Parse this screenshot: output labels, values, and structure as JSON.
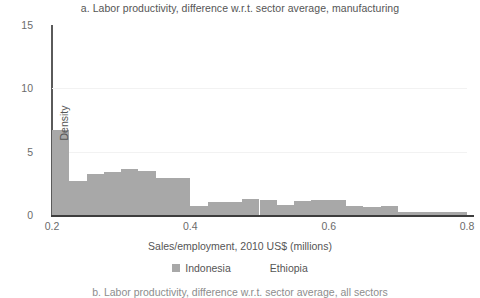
{
  "figure": {
    "panel_a_title": "a. Labor productivity, difference w.r.t. sector average, manufacturing",
    "panel_b_title": "b. Labor productivity, difference w.r.t. sector average, all sectors"
  },
  "legend": {
    "items": [
      {
        "label": "Indonesia",
        "color": "#a8a8a8"
      },
      {
        "label": "Ethiopia",
        "color": "#ffffff"
      }
    ]
  },
  "axes": {
    "y_ticks": [
      "0",
      "5",
      "10",
      "15"
    ],
    "x_ticks": [
      "0.2",
      "0.4",
      "0.6",
      "0.8"
    ],
    "x_label": "Sales/employment, 2010 US$ (millions)",
    "y_label": "Density"
  },
  "colors": {
    "bar": "#a8a8a8",
    "axis": "#3d3d3d",
    "grid": "#f2f2f2",
    "text": "#555555"
  },
  "chart_data": {
    "type": "bar",
    "title": "a. Labor productivity, difference w.r.t. sector average, manufacturing",
    "xlabel": "Sales/employment, 2010 US$ (millions)",
    "ylabel": "Density",
    "xlim": [
      0.2,
      0.8
    ],
    "ylim": [
      0,
      15
    ],
    "grid": true,
    "legend_position": "bottom",
    "bin_width": 0.025,
    "series": [
      {
        "name": "Indonesia",
        "color": "#a8a8a8",
        "bin_starts": [
          0.2,
          0.225,
          0.25,
          0.275,
          0.3,
          0.325,
          0.35,
          0.375,
          0.4,
          0.425,
          0.45,
          0.475,
          0.5,
          0.525,
          0.55,
          0.575,
          0.6,
          0.625,
          0.65,
          0.675,
          0.7,
          0.725,
          0.75,
          0.775
        ],
        "values": [
          6.7,
          2.7,
          3.2,
          3.4,
          3.6,
          3.5,
          2.9,
          2.9,
          0.7,
          1.0,
          1.0,
          1.3,
          1.2,
          0.8,
          1.1,
          1.2,
          1.2,
          0.7,
          0.65,
          0.7,
          0.25,
          0.2,
          0.2,
          0.25
        ]
      },
      {
        "name": "Ethiopia",
        "color": "#ffffff",
        "bin_starts": [],
        "values": []
      }
    ]
  }
}
